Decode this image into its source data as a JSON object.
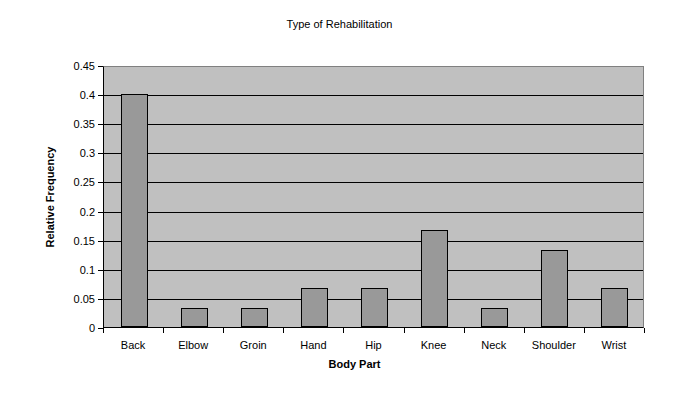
{
  "chart_data": {
    "type": "bar",
    "title": "Type of Rehabilitation",
    "xlabel": "Body Part",
    "ylabel": "Relative Frequency",
    "categories": [
      "Back",
      "Elbow",
      "Groin",
      "Hand",
      "Hip",
      "Knee",
      "Neck",
      "Shoulder",
      "Wrist"
    ],
    "values": [
      0.4,
      0.033,
      0.033,
      0.067,
      0.067,
      0.167,
      0.033,
      0.133,
      0.067
    ],
    "ylim": [
      0,
      0.45
    ],
    "yticks": [
      "0",
      "0.05",
      "0.1",
      "0.15",
      "0.2",
      "0.25",
      "0.3",
      "0.35",
      "0.4",
      "0.45"
    ],
    "grid": true,
    "legend": null,
    "colors": {
      "bar": "#999999",
      "plot_background": "#c0c0c0",
      "gridline": "#000000"
    }
  }
}
